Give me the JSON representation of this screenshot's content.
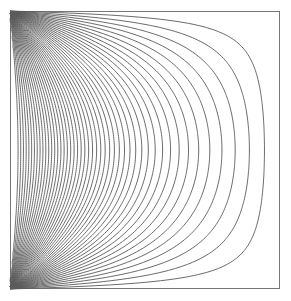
{
  "chart_data": {
    "type": "contour",
    "title": "",
    "xlabel": "",
    "ylabel": "",
    "grid": false,
    "legend": null,
    "axes_ticks": false,
    "domain": {
      "x": [
        0,
        1
      ],
      "y": [
        0,
        1
      ]
    },
    "boundary_values": {
      "left": 1,
      "right": 0,
      "top": 0,
      "bottom": 0
    },
    "levels": {
      "start": 0.02,
      "stop": 0.94,
      "step": 0.02
    },
    "series_terms": 61,
    "midline_crossings_px": [
      268,
      255,
      242,
      230,
      218,
      208,
      197,
      188,
      180,
      172,
      165,
      158,
      151,
      145,
      139,
      133,
      127,
      121,
      116,
      111,
      106,
      101,
      96,
      92,
      88,
      84,
      80,
      76,
      72,
      68,
      64,
      61,
      58,
      54,
      51,
      48,
      45,
      42,
      39,
      36,
      33,
      30,
      27,
      24,
      21,
      18,
      15
    ]
  },
  "layout": {
    "frame": {
      "left": 10,
      "top": 11,
      "right": 280,
      "bottom": 289
    },
    "colors": {
      "line": "#5a5a5a",
      "frame": "#777777",
      "background": "#ffffff"
    },
    "line_width": 0.9
  }
}
